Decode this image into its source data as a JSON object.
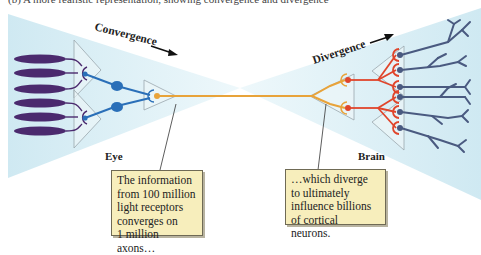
{
  "figure": {
    "partial_caption": "(b) A more realistic representation, showing convergence and divergence"
  },
  "labels": {
    "convergence": "Convergence",
    "divergence": "Divergence",
    "eye": "Eye",
    "brain": "Brain"
  },
  "callouts": {
    "left": [
      "The information",
      "from 100 million",
      "light receptors",
      "converges on",
      "1 million axons…"
    ],
    "right": [
      "…which diverge",
      "to ultimately",
      "influence billions",
      "of cortical neurons."
    ]
  },
  "colors": {
    "photoreceptor": "#4b2a6e",
    "bipolar": "#2a6fb8",
    "ganglion_axon": "#e8a33a",
    "thalamic": "#e0452b",
    "cortical": "#4a5a80",
    "background_glow": "#d8eef5",
    "callout_bg": "#f7eebc"
  }
}
